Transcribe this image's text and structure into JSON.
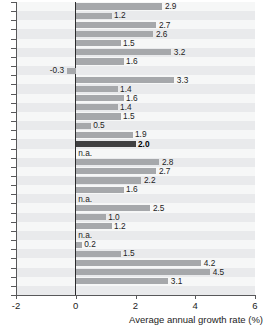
{
  "chart_data": {
    "type": "bar",
    "orientation": "horizontal",
    "title": "",
    "subtitle": "",
    "xlabel": "Average annual growth rate (%)",
    "ylabel": "",
    "xlim": [
      -2,
      6
    ],
    "xticks": [
      -2,
      0,
      2,
      4,
      6
    ],
    "xtick_labels": [
      "-2",
      "0",
      "2",
      "4",
      "6"
    ],
    "grid": false,
    "legend": null,
    "zero_line": 0,
    "categories": [
      "",
      "",
      "",
      "",
      "",
      "",
      "",
      "",
      "",
      "",
      "",
      "",
      "",
      "",
      "",
      "",
      "",
      "",
      "",
      "",
      "",
      "",
      "",
      "",
      "",
      "",
      "",
      "",
      "",
      "",
      "",
      ""
    ],
    "values": [
      2.9,
      1.2,
      2.7,
      2.6,
      1.5,
      3.2,
      1.6,
      -0.3,
      3.3,
      1.4,
      1.6,
      1.4,
      1.5,
      0.5,
      1.9,
      2.0,
      null,
      2.8,
      2.7,
      2.2,
      1.6,
      null,
      2.5,
      1.0,
      1.2,
      null,
      0.2,
      1.5,
      4.2,
      4.5,
      3.1,
      null
    ],
    "data_labels": [
      "2.9",
      "1.2",
      "2.7",
      "2.6",
      "1.5",
      "3.2",
      "1.6",
      "-0.3",
      "3.3",
      "1.4",
      "1.6",
      "1.4",
      "1.5",
      "0.5",
      "1.9",
      "2.0",
      "n.a.",
      "2.8",
      "2.7",
      "2.2",
      "1.6",
      "n.a.",
      "2.5",
      "1.0",
      "1.2",
      "n.a.",
      "0.2",
      "1.5",
      "4.2",
      "4.5",
      "3.1",
      ""
    ],
    "highlight_index": 15,
    "colors": {
      "bar": "#a6a8ab",
      "bar_highlight": "#3f3f41",
      "plot_background": "#eeeff0",
      "axis": "#58585a",
      "zero_line": "#2b2b2d",
      "text": "#1c1c1c"
    }
  }
}
